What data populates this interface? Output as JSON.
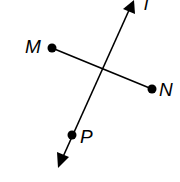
{
  "diagram": {
    "line_label": "l",
    "points": {
      "M": {
        "label": "M",
        "x": 52,
        "y": 48
      },
      "N": {
        "label": "N",
        "x": 152,
        "y": 89
      },
      "P": {
        "label": "P",
        "x": 72,
        "y": 135
      }
    },
    "segment": "MN",
    "line": {
      "name": "l",
      "from": [
        133,
        1
      ],
      "to": [
        58,
        168
      ],
      "arrows": "both"
    },
    "colors": {
      "stroke": "#000000",
      "background": "#ffffff"
    }
  }
}
